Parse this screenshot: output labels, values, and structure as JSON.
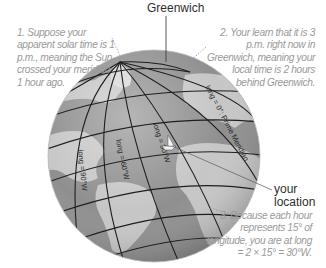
{
  "title_label": "Greenwich",
  "notes": {
    "n1": "1. Suppose your apparent solar time is 1 p.m., meaning the Sun crossed your meridian 1 hour ago.",
    "n2": "2. Your learn that it is 3 p.m. right now in Greenwich, meaning your local time is 2 hours behind Greenwich.",
    "n3": "3. Because each hour represents 15° of longitude, you are at long = 2 × 15° = 30°W."
  },
  "location_label": "your location",
  "globe_labels": {
    "prime": "long = 0°: Prime Meridian",
    "w30": "long = 30°W",
    "w60": "long = 60°W",
    "w90": "long = 90°W"
  },
  "colors": {
    "ocean": "#8e8e8e",
    "land": "#c4c4c4",
    "grid": "#1e1e1e",
    "note_text": "#9a9a9a"
  }
}
